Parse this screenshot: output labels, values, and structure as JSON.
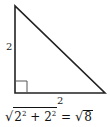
{
  "diagram": {
    "type": "right-triangle",
    "left_side_label": "2",
    "bottom_side_label": "2",
    "right_angle_marker": true,
    "colors": {
      "stroke": "#222222",
      "marker": "#555555",
      "background": "#ffffff"
    }
  },
  "equation": {
    "radical_symbol": "√",
    "term1_base": "2",
    "term1_exp": "2",
    "plus": "+",
    "term2_base": "2",
    "term2_exp": "2",
    "equals": "=",
    "result_radicand": "8",
    "text": "√(2² + 2²) = √8"
  }
}
